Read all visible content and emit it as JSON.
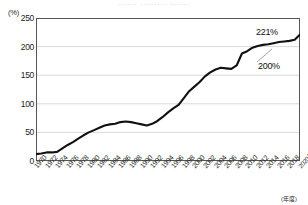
{
  "cut_header": "······  ········  ······",
  "axis_note": "(年度)",
  "colors": {
    "line": "#111111",
    "grid": "#d9d9d9",
    "axis": "#444444",
    "text": "#1a1a1a",
    "plot_border": "#555555"
  },
  "annotations": [
    {
      "label": "221%",
      "x": 256,
      "y": 27
    },
    {
      "label": "200%",
      "x": 258,
      "y": 61
    }
  ],
  "chart_data": {
    "type": "line",
    "title": "",
    "subtitle": "",
    "xlabel": "(年度)",
    "ylabel": "(%)",
    "ylim": [
      0,
      250
    ],
    "yticks": [
      0,
      50,
      100,
      150,
      200,
      250
    ],
    "ytick_labels": [
      "0",
      "50",
      "100",
      "150",
      "200",
      "250"
    ],
    "grid": true,
    "legend": "none",
    "xlim": [
      1970,
      2020
    ],
    "xtick_labels": [
      "1970",
      "1972",
      "1974",
      "1976",
      "1978",
      "1980",
      "1982",
      "1984",
      "1986",
      "1988",
      "1990",
      "1992",
      "1994",
      "1996",
      "1998",
      "2000",
      "2002",
      "2004",
      "2006",
      "2008",
      "2010",
      "2012",
      "2014",
      "2016",
      "2018",
      "2020年度"
    ],
    "series": [
      {
        "name": "債務残高対GDP比",
        "x": [
          1970,
          1971,
          1972,
          1973,
          1974,
          1975,
          1976,
          1977,
          1978,
          1979,
          1980,
          1981,
          1982,
          1983,
          1984,
          1985,
          1986,
          1987,
          1988,
          1989,
          1990,
          1991,
          1992,
          1993,
          1994,
          1995,
          1996,
          1997,
          1998,
          1999,
          2000,
          2001,
          2002,
          2003,
          2004,
          2005,
          2006,
          2007,
          2008,
          2009,
          2010,
          2011,
          2012,
          2013,
          2014,
          2015,
          2016,
          2017,
          2018,
          2019,
          2020
        ],
        "values": [
          12,
          13,
          15,
          15,
          16,
          22,
          28,
          33,
          39,
          45,
          50,
          54,
          58,
          62,
          64,
          65,
          68,
          69,
          68,
          66,
          64,
          62,
          65,
          70,
          77,
          85,
          92,
          98,
          110,
          122,
          130,
          138,
          148,
          155,
          160,
          163,
          162,
          161,
          167,
          188,
          192,
          198,
          201,
          203,
          204,
          206,
          208,
          209,
          210,
          212,
          221
        ]
      }
    ],
    "callouts": [
      {
        "text": "221%",
        "x": 2020,
        "value": 221
      },
      {
        "text": "200%",
        "x": 2019,
        "value": 212
      }
    ]
  }
}
